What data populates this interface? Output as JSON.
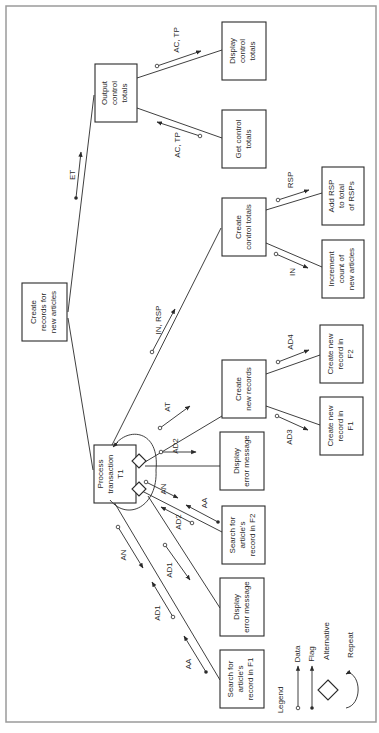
{
  "diagram": {
    "type": "structure-chart",
    "orientation": "rotated-90-ccw",
    "colors": {
      "ink": "#2a2a2a",
      "frame": "#9a9a9a",
      "background": "#ffffff"
    },
    "modules": {
      "root": [
        "Create",
        "records for",
        "new articles"
      ],
      "output_totals": [
        "Output",
        "control",
        "totals"
      ],
      "display_totals": [
        "Display",
        "control",
        "totals"
      ],
      "get_totals": [
        "Get control",
        "totals"
      ],
      "create_totals": [
        "Create",
        "control totals"
      ],
      "add_rsp": [
        "Add RSP",
        "to total",
        "of RSPs"
      ],
      "increment_count": [
        "Increment",
        "count of",
        "new articles"
      ],
      "process_tx": [
        "Process",
        "transaction",
        "T1"
      ],
      "create_records": [
        "Create",
        "new records"
      ],
      "new_rec_f2": [
        "Create new",
        "record in",
        "F2"
      ],
      "new_rec_f1": [
        "Create new",
        "record in",
        "F1"
      ],
      "display_err_2": [
        "Display",
        "error message"
      ],
      "search_f2": [
        "Search for",
        "article's",
        "record in F2"
      ],
      "display_err_1": [
        "Display",
        "error message"
      ],
      "search_f1": [
        "Search for",
        "article's",
        "record in F1"
      ]
    },
    "couples": {
      "et": "ET",
      "ac_tp_out": "AC, TP",
      "ac_tp_in": "AC, TP",
      "in_rsp": "IN, RSP",
      "rsp": "RSP",
      "in": "IN",
      "at": "AT",
      "ad2_top": "AD2",
      "ad4": "AD4",
      "ad3": "AD3",
      "an_f2": "AN",
      "aa_f2": "AA",
      "ad2_f2": "AD2",
      "ad1_err": "AD1",
      "an_f1": "AN",
      "ad1_f1": "AD1",
      "aa_f1": "AA"
    },
    "legend": {
      "title": "Legend",
      "items": [
        {
          "symbol": "data-couple",
          "label": "Data"
        },
        {
          "symbol": "flag-couple",
          "label": "Flag"
        },
        {
          "symbol": "diamond",
          "label": "Alternative"
        },
        {
          "symbol": "loop-arc",
          "label": "Repeat"
        }
      ]
    }
  }
}
